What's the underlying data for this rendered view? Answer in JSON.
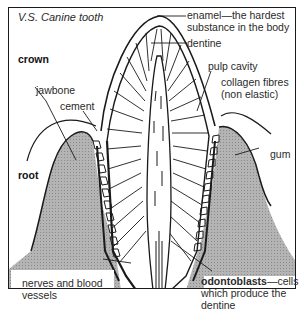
{
  "diagram": {
    "title": "V.S. Canine tooth",
    "regions": {
      "crown": "crown",
      "root": "root"
    },
    "labels": {
      "enamel": "enamel—the hardest",
      "enamel_line2": "substance in the body",
      "dentine": "dentine",
      "pulp_cavity": "pulp cavity",
      "collagen": "collagen fibres",
      "collagen_line2": "(non elastic)",
      "jawbone": "jawbone",
      "cement": "cement",
      "gum": "gum",
      "nerves": "nerves and blood",
      "nerves_line2": "vessels",
      "odontoblasts_bold": "odontoblasts",
      "odontoblasts_rest": "—cells",
      "odontoblasts_line2": "which produce the",
      "odontoblasts_line3": "dentine"
    },
    "colors": {
      "line": "#1a1a1a",
      "gum_fill": "#a8a8a8",
      "background": "#ffffff"
    }
  }
}
